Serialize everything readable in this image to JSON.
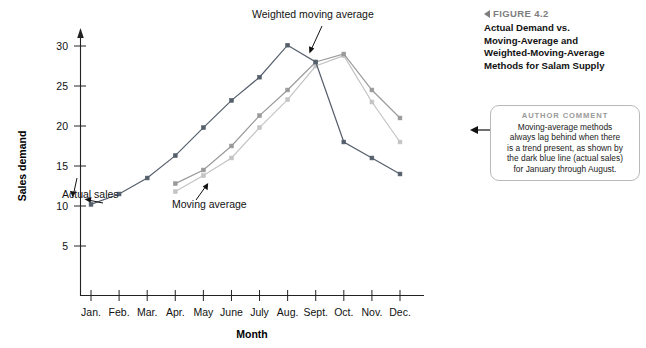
{
  "figure": {
    "number_label": "FIGURE 4.2",
    "caption_lines": [
      "Actual Demand vs.",
      "Moving-Average and",
      "Weighted-Moving-Average",
      "Methods for Salam Supply"
    ],
    "caption_text": "Actual Demand vs. Moving-Average and Weighted-Moving-Average Methods for Salam Supply",
    "marker_color": "#7d7d7d"
  },
  "author_comment": {
    "title": "AUTHOR COMMENT",
    "lines": [
      "Moving-average methods",
      "always lag behind when there",
      "is a trend present, as shown by",
      "the dark blue line (actual sales)",
      "for January through August."
    ],
    "text": "Moving-average methods always lag behind when there is a trend present, as shown by the dark blue line (actual sales) for January through August."
  },
  "chart_data": {
    "type": "line",
    "title": "",
    "xlabel": "Month",
    "ylabel": "Sales demand",
    "categories": [
      "Jan.",
      "Feb.",
      "Mar.",
      "Apr.",
      "May",
      "June",
      "July",
      "Aug.",
      "Sept.",
      "Oct.",
      "Nov.",
      "Dec."
    ],
    "yticks": [
      5,
      10,
      15,
      20,
      25,
      30
    ],
    "ylim": [
      0,
      32
    ],
    "grid": false,
    "legend": "inline-annotations",
    "series": [
      {
        "name": "Actual sales",
        "color": "#555f6b",
        "values": [
          10.2,
          11.5,
          13.5,
          16.3,
          19.8,
          23.2,
          26.1,
          30.1,
          28.0,
          18.0,
          16.0,
          14.0
        ]
      },
      {
        "name": "Weighted moving average",
        "color": "#9a9a9a",
        "values": [
          null,
          null,
          null,
          12.8,
          14.5,
          17.5,
          21.3,
          24.5,
          28.0,
          29.0,
          24.5,
          21.0
        ]
      },
      {
        "name": "Moving average",
        "color": "#c4c4c4",
        "values": [
          null,
          null,
          null,
          11.8,
          13.8,
          16.0,
          19.8,
          23.3,
          27.5,
          28.8,
          23.0,
          18.0
        ]
      }
    ],
    "annotations": [
      {
        "text": "Actual sales",
        "series": "Actual sales"
      },
      {
        "text": "Moving average",
        "series": "Moving average"
      },
      {
        "text": "Weighted moving average",
        "series": "Weighted moving average"
      }
    ]
  }
}
